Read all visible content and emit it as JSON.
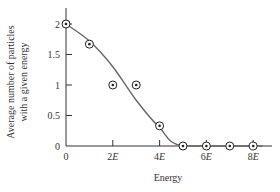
{
  "chart_data": {
    "type": "scatter",
    "title": "",
    "xlabel": "Energy",
    "ylabel": "Average number of particles with a given energy",
    "ylabel_lines": [
      "Average number of particles",
      "with a given energy"
    ],
    "x_ticks": [
      "0",
      "2E",
      "4E",
      "6E",
      "8E"
    ],
    "y_ticks": [
      "0",
      "0.5",
      "1",
      "1.5",
      "2"
    ],
    "xlim": [
      0,
      8.5
    ],
    "ylim": [
      0,
      2.3
    ],
    "grid": false,
    "series": [
      {
        "name": "data points",
        "marker": "circled-dot",
        "x": [
          0,
          1,
          2,
          3,
          4,
          5,
          6,
          7,
          8
        ],
        "y": [
          2,
          1.67,
          1,
          1,
          0.33,
          0,
          0,
          0,
          0
        ]
      },
      {
        "name": "smooth fit curve",
        "type": "line",
        "x": [
          0,
          1,
          2,
          3,
          4,
          5,
          8.4
        ],
        "y": [
          2,
          1.72,
          1.3,
          0.75,
          0.3,
          0,
          0
        ]
      }
    ],
    "x_unit": "E"
  },
  "colors": {
    "axis": "#333333",
    "curve": "#666666",
    "marker": "#222222"
  }
}
